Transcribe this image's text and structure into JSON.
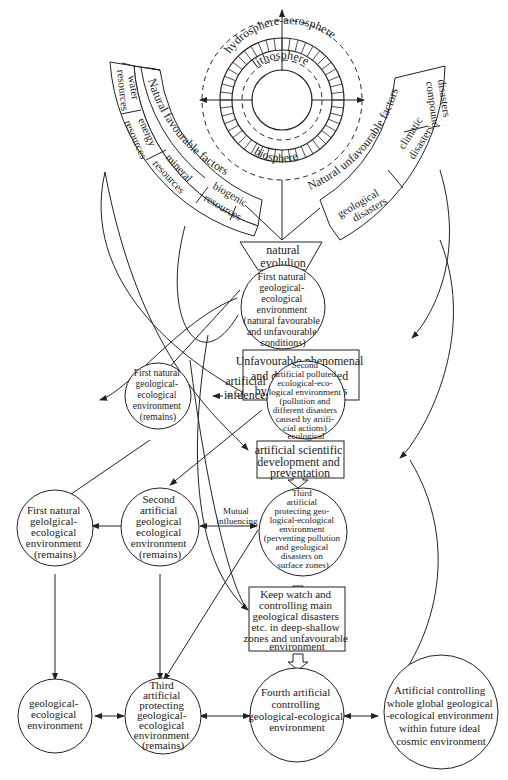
{
  "spheres": {
    "outer": "hydrosphere-aerosphere",
    "middle": "lithosphere",
    "inner": "biosphere"
  },
  "favourable": {
    "title": "Natural favourable factors",
    "items": [
      "water resources",
      "energy resources",
      "mineral resources",
      "biogenic resources"
    ],
    "water": [
      "water",
      "resources"
    ],
    "energy": [
      "energy",
      "resources"
    ],
    "mineral": [
      "mineral",
      "resources"
    ],
    "biogenic": [
      "biogenic",
      "resources"
    ]
  },
  "unfavourable": {
    "title": "Natural unfavourable factors",
    "items": [
      "compound disasters",
      "climatic disasters",
      "geological disasters"
    ],
    "compound": [
      "compound",
      "disasters"
    ],
    "climatic": [
      "climatic",
      "disasters"
    ],
    "geological": [
      "geological",
      "disasters"
    ]
  },
  "nodes": {
    "natural_evolution": [
      "natural",
      "evolulion"
    ],
    "first_natural": [
      "First natural",
      "geological-",
      "ecological",
      "environment",
      "(natural favourable",
      "and unfavourable",
      "conditions)"
    ],
    "unfavourable_box": [
      "Unfavourable phenomenal",
      "and disasters caused",
      "by artificial actions"
    ],
    "first_natural_remains_1": [
      "First natural",
      "geological-",
      "ecological",
      "environment",
      "(remains)"
    ],
    "second_polluted": [
      "Second",
      "artificial polluted",
      "ecological-eco-",
      "logical environment",
      "(pollution and",
      "different disasters",
      "caused by artifi-",
      "cial actions)",
      "ecological"
    ],
    "scientific_box": [
      "artificial scientific",
      "development and",
      "preventation"
    ],
    "first_natural_remains_2": [
      "First natural",
      "gelolgical-",
      "ecological",
      "environment",
      "(remains)"
    ],
    "second_remains": [
      "Second",
      "artificial",
      "geological",
      "ecological",
      "environment",
      "(remains)"
    ],
    "third_protecting": [
      "Third",
      "artificial",
      "protecting geo-",
      "logical-ecological",
      "environment",
      "(perventing pollution",
      "and geological",
      "disasters on",
      "surface zones)"
    ],
    "keep_watch_box": [
      "Keep watch and",
      "controlling main",
      "geological disasters",
      "etc. in deep-shallow",
      "zones and unfavourable",
      "environment"
    ],
    "geo_eco": [
      "geological-",
      "ecological",
      "environment"
    ],
    "third_remains": [
      "Third",
      "artificial",
      "protecting",
      "geological-",
      "ecological",
      "environment",
      "(remains)"
    ],
    "fourth": [
      "Fourth artificial",
      "controlling",
      "geological-ecological",
      "environment"
    ],
    "cosmic": [
      "Artificial controlling",
      "whole global geological",
      "-ecological environment",
      "within future ideal",
      "cosmic environment"
    ]
  },
  "labels": {
    "artificial_influences": [
      "artificial",
      "infuences"
    ],
    "mutual": [
      "Mutual",
      "influencing"
    ]
  }
}
